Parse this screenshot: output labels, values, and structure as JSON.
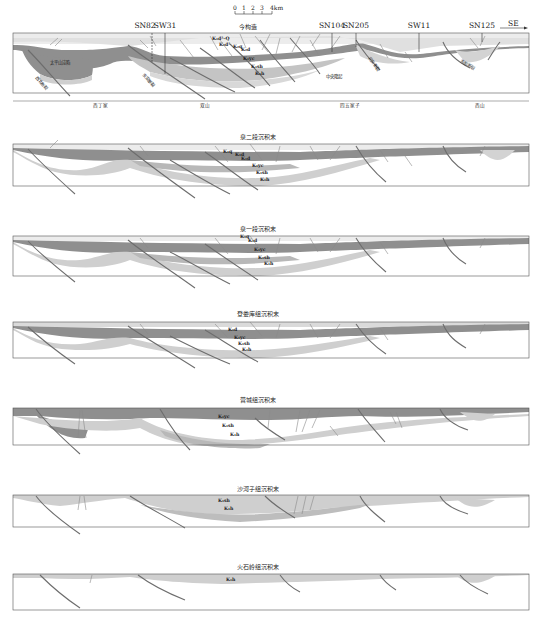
{
  "figure": {
    "type": "geological cross-section evolution",
    "direction_label": "SE",
    "scale_bar": {
      "ticks": [
        "0",
        "1",
        "2",
        "3"
      ],
      "unit_label": "4km"
    },
    "colors": {
      "frame": "#555555",
      "fault": "#666666",
      "layer_top_light": "#e9e9e9",
      "layer_pale": "#dadada",
      "layer_mid": "#c4c4c4",
      "layer_dark": "#8f8f8f",
      "layer_lower": "#cfcfcf",
      "basement": "#ffffff"
    }
  },
  "panels": [
    {
      "id": "present",
      "title": "",
      "top_label": "今构造",
      "wells": [
        "SN82",
        "SW31",
        "SN104",
        "SN205",
        "SW11",
        "SN125"
      ],
      "formations": [
        "K₁d²–Q",
        "K₂d¹",
        "K₂q",
        "K₂d",
        "K₁yc",
        "K₁sh",
        "K₁h"
      ],
      "structure_labels": [
        "太平山洼陷",
        "中央隆起"
      ],
      "fault_labels": [
        "西北断裂",
        "东安断裂",
        "北东断裂",
        "东部断裂"
      ],
      "locations": [
        "西丁家",
        "双山",
        "四五家子",
        "西山"
      ]
    },
    {
      "id": "q2",
      "title": "泉二段沉积末",
      "formations": [
        "K₁q",
        "K₁d",
        "K₁d",
        "K₁yc",
        "K₁sh",
        "K₁h"
      ]
    },
    {
      "id": "q1",
      "title": "泉一段沉积末",
      "formations": [
        "K₁q",
        "K₁d",
        "K₁yc",
        "K₁sh",
        "K₁h"
      ]
    },
    {
      "id": "dls",
      "title": "登娄库组沉积末",
      "formations": [
        "K₁d",
        "K₁yc",
        "K₁sh",
        "K₁h"
      ]
    },
    {
      "id": "yc",
      "title": "营城组沉积末",
      "formations": [
        "K₁yc",
        "K₁sh",
        "K₁h"
      ]
    },
    {
      "id": "shz",
      "title": "沙河子组沉积末",
      "formations": [
        "K₁sh",
        "K₁h"
      ]
    },
    {
      "id": "hsl",
      "title": "火石岭组沉积末",
      "formations": [
        "K₁h"
      ]
    }
  ]
}
